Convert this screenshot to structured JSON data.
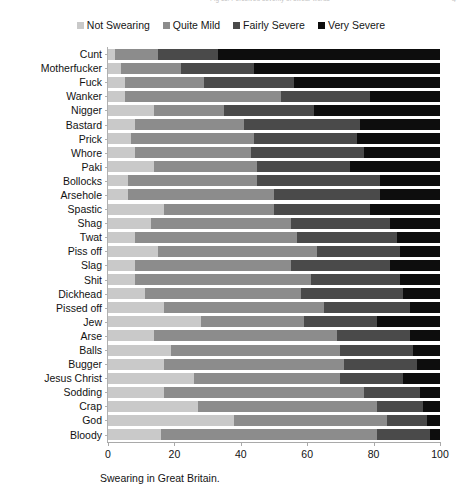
{
  "top_cropped_text": "Fig 11. Perceived severity of swear words",
  "top_cropped_page": "4",
  "legend": {
    "items": [
      {
        "label": "Not Swearing",
        "color": "#c9c9c9"
      },
      {
        "label": "Quite Mild",
        "color": "#8c8c8c"
      },
      {
        "label": "Fairly Severe",
        "color": "#4a4a4a"
      },
      {
        "label": "Very Severe",
        "color": "#0d0d0d"
      }
    ]
  },
  "caption": "Swearing in Great Britain.",
  "chart_data": {
    "type": "bar",
    "orientation": "horizontal",
    "stacked": true,
    "normalized_percent": true,
    "title": "",
    "xlabel": "",
    "ylabel": "",
    "xlim": [
      0,
      100
    ],
    "xticks": [
      0,
      20,
      40,
      60,
      80,
      100
    ],
    "grid": false,
    "legend_position": "top-center",
    "categories": [
      "Cunt",
      "Motherfucker",
      "Fuck",
      "Wanker",
      "Nigger",
      "Bastard",
      "Prick",
      "Whore",
      "Paki",
      "Bollocks",
      "Arsehole",
      "Spastic",
      "Shag",
      "Twat",
      "Piss off",
      "Slag",
      "Shit",
      "Dickhead",
      "Pissed off",
      "Jew",
      "Arse",
      "Balls",
      "Bugger",
      "Jesus Christ",
      "Sodding",
      "Crap",
      "God",
      "Bloody"
    ],
    "series": [
      {
        "name": "Not Swearing",
        "color": "#c9c9c9",
        "values": [
          2,
          4,
          5,
          5,
          14,
          8,
          7,
          8,
          14,
          6,
          6,
          17,
          13,
          8,
          15,
          8,
          8,
          11,
          17,
          28,
          14,
          19,
          17,
          26,
          17,
          27,
          38,
          16
        ]
      },
      {
        "name": "Quite Mild",
        "color": "#8c8c8c",
        "values": [
          13,
          18,
          24,
          47,
          21,
          33,
          37,
          35,
          31,
          39,
          44,
          33,
          42,
          49,
          48,
          47,
          53,
          47,
          48,
          31,
          55,
          51,
          54,
          44,
          60,
          54,
          46,
          65
        ]
      },
      {
        "name": "Fairly Severe",
        "color": "#4a4a4a",
        "values": [
          18,
          22,
          27,
          27,
          27,
          35,
          31,
          34,
          28,
          37,
          32,
          29,
          30,
          30,
          25,
          30,
          27,
          31,
          26,
          22,
          22,
          22,
          22,
          19,
          17,
          14,
          12,
          16
        ]
      },
      {
        "name": "Very Severe",
        "color": "#0d0d0d",
        "values": [
          67,
          56,
          44,
          21,
          38,
          24,
          25,
          23,
          27,
          18,
          18,
          21,
          15,
          13,
          12,
          15,
          12,
          11,
          9,
          19,
          9,
          8,
          7,
          11,
          6,
          5,
          4,
          3
        ]
      }
    ]
  }
}
